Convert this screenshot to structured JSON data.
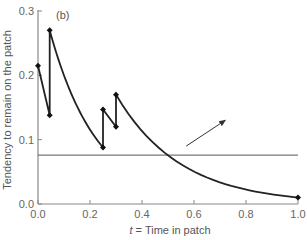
{
  "chart_data": {
    "type": "line",
    "panel_label": "(b)",
    "xlabel_italic": "t",
    "xlabel_rest": " = Time in patch",
    "xlabel": "t = Time in patch",
    "ylabel": "Tendency to remain on the patch",
    "xlim": [
      0.0,
      1.0
    ],
    "ylim": [
      0.0,
      0.3
    ],
    "x_ticks": [
      "0.0",
      "0.2",
      "0.4",
      "0.6",
      "0.8",
      "1.0"
    ],
    "y_ticks": [
      "0.0",
      "0.1",
      "0.2",
      "0.3"
    ],
    "series": [
      {
        "name": "tendency",
        "points": [
          {
            "x": 0.0,
            "y": 0.215
          },
          {
            "x": 0.045,
            "y": 0.138
          },
          {
            "x": 0.045,
            "y": 0.27
          },
          {
            "x": 0.25,
            "y": 0.088
          },
          {
            "x": 0.25,
            "y": 0.147
          },
          {
            "x": 0.3,
            "y": 0.12
          },
          {
            "x": 0.3,
            "y": 0.17
          },
          {
            "x": 1.0,
            "y": 0.01
          }
        ],
        "markers_at": [
          {
            "x": 0.0,
            "y": 0.215
          },
          {
            "x": 0.045,
            "y": 0.138
          },
          {
            "x": 0.045,
            "y": 0.27
          },
          {
            "x": 0.25,
            "y": 0.088
          },
          {
            "x": 0.25,
            "y": 0.147
          },
          {
            "x": 0.3,
            "y": 0.12
          },
          {
            "x": 0.3,
            "y": 0.17
          },
          {
            "x": 1.0,
            "y": 0.01
          }
        ]
      }
    ],
    "threshold_line": {
      "y": 0.076
    },
    "annotations": [
      {
        "type": "arrow",
        "from": {
          "x": 0.57,
          "y": 0.09
        },
        "to": {
          "x": 0.72,
          "y": 0.13
        }
      }
    ],
    "grid": false,
    "legend": null
  }
}
